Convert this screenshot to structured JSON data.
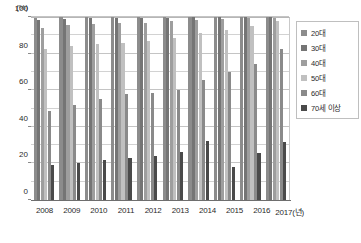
{
  "chart_data": {
    "type": "bar",
    "title": "",
    "subtitle": "",
    "xlabel": "(년)",
    "ylabel": "(%)",
    "ylim": [
      0,
      100
    ],
    "yticks": [
      0,
      20,
      40,
      60,
      80,
      100
    ],
    "ytick_labels": [
      "0",
      "20",
      "40",
      "60",
      "80",
      "100"
    ],
    "gridline_values": [
      10,
      20,
      30,
      40,
      50,
      60,
      70,
      80,
      90,
      100
    ],
    "grid": true,
    "legend_position": "right",
    "categories": [
      "2008",
      "2009",
      "2010",
      "2011",
      "2012",
      "2013",
      "2014",
      "2015",
      "2016",
      "2017"
    ],
    "xtick_labels": [
      "2008",
      "2009",
      "2010",
      "2011",
      "2012",
      "2013",
      "2014",
      "2015",
      "2016",
      "2017(년)"
    ],
    "series": [
      {
        "name": "20대",
        "color": "#8c8c8c",
        "values": [
          99.7,
          99.9,
          99.9,
          99.9,
          99.9,
          99.9,
          99.9,
          99.9,
          99.9,
          99.9
        ]
      },
      {
        "name": "30대",
        "color": "#757575",
        "values": [
          98.6,
          99.0,
          99.4,
          99.6,
          99.7,
          99.7,
          99.8,
          99.8,
          99.9,
          99.9
        ]
      },
      {
        "name": "40대",
        "color": "#9e9e9e",
        "values": [
          94.0,
          95.4,
          96.0,
          96.6,
          97.0,
          97.7,
          98.4,
          98.8,
          99.3,
          99.7
        ]
      },
      {
        "name": "50대",
        "color": "#c0c0c0",
        "values": [
          82.3,
          84.4,
          85.2,
          86.0,
          87.0,
          88.8,
          91.1,
          93.1,
          95.0,
          97.9
        ]
      },
      {
        "name": "60대",
        "color": "#8a8a8a",
        "values": [
          48.9,
          51.8,
          55.1,
          58.0,
          58.6,
          60.0,
          65.6,
          69.9,
          74.5,
          82.5
        ]
      },
      {
        "name": "70세 이상",
        "color": "#4a4a4a",
        "values": [
          19.0,
          20.1,
          21.7,
          23.0,
          24.2,
          26.1,
          32.5,
          17.9,
          25.9,
          31.7
        ]
      }
    ]
  },
  "legend": {
    "items": [
      {
        "label": "20대"
      },
      {
        "label": "30대"
      },
      {
        "label": "40대"
      },
      {
        "label": "50대"
      },
      {
        "label": "60대"
      },
      {
        "label": "70세 이상"
      }
    ]
  }
}
